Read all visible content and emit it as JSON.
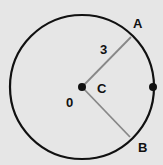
{
  "diagram": {
    "background": "#e6e6e6",
    "circle": {
      "cx": 82,
      "cy": 87,
      "r": 72,
      "stroke": "#111111",
      "stroke_width": 2.2
    },
    "center_point": {
      "x": 82,
      "y": 87,
      "label": "C"
    },
    "radii": [
      {
        "from": "C",
        "to": "A",
        "x2": 131,
        "y2": 37,
        "color": "#888888"
      },
      {
        "from": "C",
        "to": "B",
        "x2": 130,
        "y2": 137,
        "color": "#888888"
      }
    ],
    "right_point": {
      "x": 153,
      "y": 87
    },
    "labels": {
      "A": "A",
      "B": "B",
      "C": "C",
      "radius_length": "3",
      "angle_or_origin": "0"
    }
  }
}
